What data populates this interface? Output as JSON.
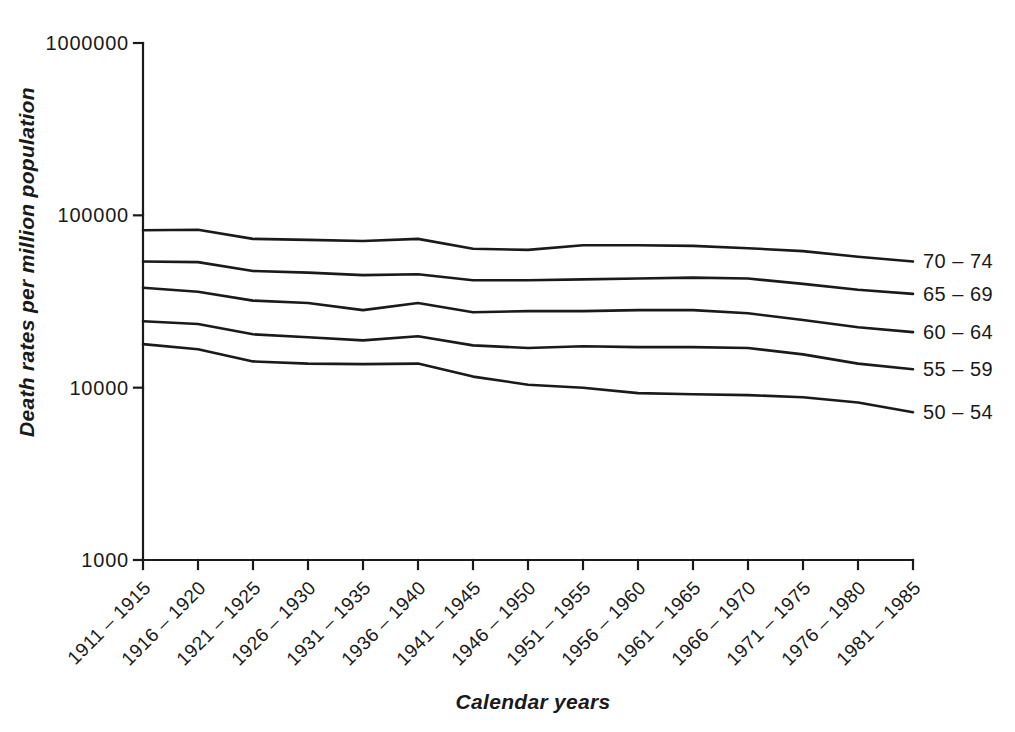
{
  "page": {
    "background_color": "#ffffff",
    "text_color": "#1a1a1a",
    "line_color": "#1a1a1a"
  },
  "chart_data": {
    "type": "line",
    "title": "",
    "xlabel": "Calendar years",
    "ylabel": "Death rates per million population",
    "y_scale": "log",
    "ylim": [
      1000,
      1000000
    ],
    "yticks": [
      "1000",
      "10000",
      "100000",
      "1000000"
    ],
    "grid": false,
    "legend_position": "right of line ends",
    "categories": [
      "1911 – 1915",
      "1916 – 1920",
      "1921 – 1925",
      "1926 – 1930",
      "1931 – 1935",
      "1936 – 1940",
      "1941 – 1945",
      "1946 – 1950",
      "1951 – 1955",
      "1956 – 1960",
      "1961 – 1965",
      "1966 – 1970",
      "1971 – 1975",
      "1976 – 1980",
      "1981 – 1985"
    ],
    "series": [
      {
        "name": "70 – 74",
        "values": [
          82000,
          82500,
          73000,
          72000,
          71000,
          73000,
          64000,
          63000,
          67000,
          67000,
          66500,
          64500,
          62000,
          57500,
          54000
        ]
      },
      {
        "name": "65 – 69",
        "values": [
          54000,
          53500,
          47500,
          46500,
          45000,
          45500,
          42000,
          42000,
          42500,
          43000,
          43500,
          43000,
          40000,
          37000,
          35000
        ]
      },
      {
        "name": "60 – 64",
        "values": [
          38000,
          36000,
          32000,
          31000,
          28200,
          31000,
          27400,
          27800,
          27800,
          28200,
          28200,
          27000,
          24700,
          22400,
          21000
        ]
      },
      {
        "name": "55 – 59",
        "values": [
          24300,
          23400,
          20400,
          19600,
          18800,
          19900,
          17600,
          17000,
          17400,
          17200,
          17200,
          17000,
          15600,
          13800,
          12800
        ]
      },
      {
        "name": "50 – 54",
        "values": [
          17900,
          16700,
          14200,
          13800,
          13700,
          13800,
          11600,
          10400,
          10000,
          9300,
          9150,
          9050,
          8800,
          8200,
          7200
        ]
      }
    ]
  }
}
